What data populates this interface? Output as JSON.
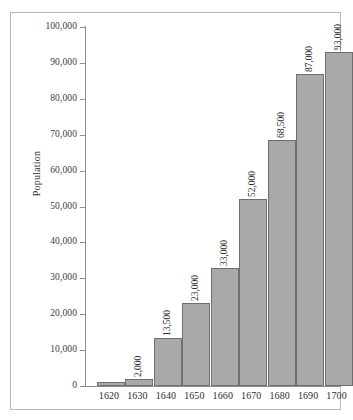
{
  "chart_data": {
    "type": "bar",
    "title": "",
    "xlabel": "",
    "ylabel": "Population",
    "categories": [
      "1620",
      "1630",
      "1640",
      "1650",
      "1660",
      "1670",
      "1680",
      "1690",
      "1700"
    ],
    "values": [
      1000,
      2000,
      13500,
      23000,
      33000,
      52000,
      68500,
      87000,
      93000
    ],
    "data_labels": [
      "",
      "2,000",
      "13,500",
      "23,000",
      "33,000",
      "52,000",
      "68,500",
      "87,000",
      "93,000"
    ],
    "ylim": [
      0,
      100000
    ],
    "y_ticks": [
      0,
      10000,
      20000,
      30000,
      40000,
      50000,
      60000,
      70000,
      80000,
      90000,
      100000
    ],
    "y_tick_labels": [
      "0",
      "10,000",
      "20,000",
      "30,000",
      "40,000",
      "50,000",
      "60,000",
      "70,000",
      "80,000",
      "90,000",
      "100,000"
    ],
    "grid": false,
    "legend": null,
    "bar_color": "#a9a9a9",
    "bar_edge_color": "#6f6f6f",
    "axis_color": "#8e8e8e",
    "background_color": "#ffffff",
    "frame_color": "#b9b9b9",
    "label_rotation": "vertical"
  }
}
